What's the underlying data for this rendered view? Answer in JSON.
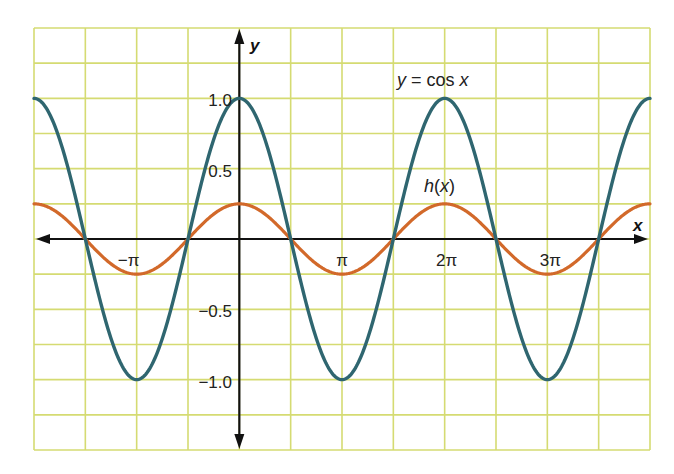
{
  "chart_data": {
    "type": "line",
    "title": "",
    "xlabel": "x",
    "ylabel": "y",
    "xlim": [
      -6.283185,
      12.566371
    ],
    "ylim": [
      -1.5,
      1.5
    ],
    "grid": true,
    "grid_x_step": 1.570796,
    "grid_y_step": 0.25,
    "x_ticks": [
      {
        "value": -3.141593,
        "label": "−π"
      },
      {
        "value": 3.141593,
        "label": "π"
      },
      {
        "value": 6.283185,
        "label": "2π"
      },
      {
        "value": 9.424778,
        "label": "3π"
      }
    ],
    "y_ticks": [
      {
        "value": 1.0,
        "label": "1.0"
      },
      {
        "value": 0.5,
        "label": "0.5"
      },
      {
        "value": -0.5,
        "label": "−0.5"
      },
      {
        "value": -1.0,
        "label": "−1.0"
      }
    ],
    "series": [
      {
        "name": "y = cos x",
        "function": "cos(x)",
        "amplitude": 1.0,
        "period": 6.283185,
        "color": "#2f6670",
        "x": [
          -6.2832,
          -4.7124,
          -3.1416,
          -1.5708,
          0,
          1.5708,
          3.1416,
          4.7124,
          6.2832,
          7.854,
          9.4248,
          10.9956,
          12.5664
        ],
        "values": [
          1,
          0,
          -1,
          0,
          1,
          0,
          -1,
          0,
          1,
          0,
          -1,
          0,
          1
        ]
      },
      {
        "name": "h(x)",
        "function": "0.25*cos(x)",
        "amplitude": 0.25,
        "period": 6.283185,
        "color": "#d2692a",
        "x": [
          -6.2832,
          -4.7124,
          -3.1416,
          -1.5708,
          0,
          1.5708,
          3.1416,
          4.7124,
          6.2832,
          7.854,
          9.4248,
          10.9956,
          12.5664
        ],
        "values": [
          0.25,
          0,
          -0.25,
          0,
          0.25,
          0,
          -0.25,
          0,
          0.25,
          0,
          -0.25,
          0,
          0.25
        ]
      }
    ],
    "annotations": [
      {
        "text": "y = cos x",
        "x": 6.283185,
        "y": 1.25
      },
      {
        "text": "h(x)",
        "x": 6.283185,
        "y": 0.5
      }
    ]
  },
  "labels": {
    "x_axis": "x",
    "y_axis": "y",
    "cos_label_var": "y",
    "cos_label_eq": " = cos ",
    "cos_label_x": "x",
    "h_label": "h",
    "h_label_paren_open": "(",
    "h_label_x": "x",
    "h_label_paren_close": ")"
  },
  "colors": {
    "grid": "#d5db72",
    "axis": "#111111",
    "cos_curve": "#2f6670",
    "h_curve": "#d2692a",
    "background": "#ffffff"
  }
}
